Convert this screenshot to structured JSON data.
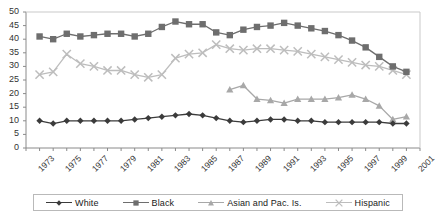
{
  "chart_data": {
    "type": "line",
    "title": "",
    "subtitle": "",
    "xlabel": "",
    "ylabel": "",
    "xlim": [
      1973,
      2002
    ],
    "ylim": [
      0,
      50
    ],
    "ytick_step": 5,
    "yticks": [
      0,
      5,
      10,
      15,
      20,
      25,
      30,
      35,
      40,
      45,
      50
    ],
    "xticks": [
      1973,
      1975,
      1977,
      1979,
      1981,
      1983,
      1985,
      1987,
      1989,
      1991,
      1993,
      1995,
      1997,
      1999,
      2001
    ],
    "xtick_minor_step": 1,
    "grid": false,
    "legend_position": "bottom",
    "x": [
      1973,
      1974,
      1975,
      1976,
      1977,
      1978,
      1979,
      1980,
      1981,
      1982,
      1983,
      1984,
      1985,
      1986,
      1987,
      1988,
      1989,
      1990,
      1991,
      1992,
      1993,
      1994,
      1995,
      1996,
      1997,
      1998,
      1999,
      2000,
      2001
    ],
    "series": [
      {
        "name": "White",
        "marker": "diamond",
        "color": "#3b3b3b",
        "values": [
          null,
          10,
          9,
          10,
          10,
          10,
          10,
          10,
          10.5,
          11,
          11.5,
          12,
          12.5,
          12,
          11,
          10,
          9.5,
          10,
          10.5,
          10.5,
          10,
          10,
          9.5,
          9.5,
          9.5,
          9.5,
          9.5,
          9,
          9
        ]
      },
      {
        "name": "Black",
        "marker": "square",
        "color": "#6e6e6e",
        "values": [
          null,
          41,
          40,
          42,
          41,
          41.5,
          42,
          42,
          41,
          42,
          44.5,
          46.5,
          45.5,
          45.5,
          42.5,
          41.5,
          43.5,
          44.5,
          45,
          46,
          45,
          44,
          43,
          41.5,
          39.5,
          37,
          33.5,
          30,
          28
        ]
      },
      {
        "name": "Asian and Pac. Is.",
        "marker": "triangle",
        "color": "#a8a8a8",
        "values": [
          null,
          null,
          null,
          null,
          null,
          null,
          null,
          null,
          null,
          null,
          null,
          null,
          null,
          null,
          null,
          21.5,
          23,
          18,
          17.5,
          16.5,
          18,
          18,
          18,
          18.5,
          19.5,
          18,
          15.5,
          10.5,
          11.5
        ]
      },
      {
        "name": "Hispanic",
        "marker": "cross",
        "color": "#bdbdbd",
        "values": [
          null,
          27,
          28,
          34.5,
          31,
          30,
          28.5,
          28.5,
          27,
          26,
          27,
          33,
          34.5,
          35,
          38,
          36.5,
          36,
          36.5,
          36.5,
          36,
          35.5,
          34.5,
          33.5,
          32.5,
          31.5,
          30.5,
          30,
          28.5,
          27
        ]
      }
    ]
  },
  "legend": {
    "entries": [
      {
        "label": "White"
      },
      {
        "label": "Black"
      },
      {
        "label": "Asian and Pac. Is."
      },
      {
        "label": "Hispanic"
      }
    ]
  },
  "axes": {
    "y_labels": [
      "50",
      "45",
      "40",
      "35",
      "30",
      "25",
      "20",
      "15",
      "10",
      "5",
      "0"
    ],
    "x_labels": [
      "1973",
      "1975",
      "1977",
      "1979",
      "1981",
      "1983",
      "1985",
      "1987",
      "1989",
      "1991",
      "1993",
      "1995",
      "1997",
      "1999",
      "2001"
    ]
  },
  "colors": {
    "white_series": "#3b3b3b",
    "black_series": "#6e6e6e",
    "asian_series": "#a8a8a8",
    "hispanic_series": "#bdbdbd",
    "axis": "#8a8a8a",
    "text": "#333333"
  }
}
